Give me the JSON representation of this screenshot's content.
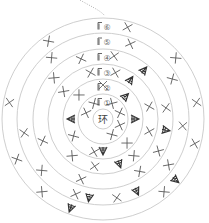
{
  "diagram": {
    "type": "crochet-round-chart",
    "center_label": "环",
    "row_labels": [
      "①",
      "②",
      "③",
      "④",
      "⑤",
      "⑥"
    ],
    "chain_icon": "chain-start-icon",
    "symbols": {
      "single_crochet": "x-stitch-icon",
      "increase": "increase-stitch-icon"
    },
    "colors": {
      "ring": "#c8c8c8",
      "stitch": "#555555",
      "increase": "#333333"
    },
    "rounds": [
      {
        "round": 1,
        "sc": [
          [
            -30,
            18
          ],
          [
            30,
            18
          ],
          [
            -70,
            18
          ],
          [
            70,
            18
          ],
          [
            110,
            18
          ],
          [
            150,
            18
          ]
        ],
        "inc": []
      },
      {
        "round": 2,
        "sc": [
          [
            -45,
            34
          ],
          [
            0,
            34
          ],
          [
            135,
            34
          ],
          [
            -120,
            34
          ],
          [
            -165,
            34
          ]
        ],
        "inc": [
          [
            45,
            32
          ],
          [
            90,
            32
          ],
          [
            -90,
            32
          ],
          [
            180,
            32
          ]
        ]
      },
      {
        "round": 3,
        "sc": [
          [
            -55,
            48
          ],
          [
            -15,
            48
          ],
          [
            15,
            48
          ],
          [
            75,
            48
          ],
          [
            105,
            48
          ],
          [
            140,
            48
          ],
          [
            -140,
            48
          ],
          [
            -170,
            48
          ]
        ],
        "inc": [
          [
            35,
            48
          ],
          [
            160,
            48
          ]
        ]
      },
      {
        "round": 4,
        "sc": [
          [
            -50,
            64
          ],
          [
            -20,
            64
          ],
          [
            10,
            64
          ],
          [
            80,
            64
          ],
          [
            120,
            64
          ],
          [
            145,
            64
          ],
          [
            -110,
            64
          ],
          [
            -160,
            64
          ]
        ],
        "inc": [
          [
            40,
            64
          ],
          [
            100,
            64
          ]
        ]
      },
      {
        "round": 5,
        "sc": [
          [
            -40,
            80
          ],
          [
            20,
            80
          ],
          [
            60,
            80
          ],
          [
            95,
            80
          ],
          [
            125,
            80
          ],
          [
            -100,
            80
          ],
          [
            -130,
            80
          ],
          [
            -160,
            80
          ],
          [
            170,
            80
          ]
        ],
        "inc": [
          [
            -170,
            80
          ],
          [
            155,
            80
          ]
        ]
      },
      {
        "round": 6,
        "sc": [
          [
            -35,
            95
          ],
          [
            15,
            95
          ],
          [
            50,
            95
          ],
          [
            80,
            95
          ],
          [
            105,
            95
          ],
          [
            140,
            95
          ],
          [
            -80,
            95
          ],
          [
            -115,
            95
          ],
          [
            -140,
            95
          ]
        ],
        "inc": [
          [
            -160,
            95
          ],
          [
            130,
            95
          ]
        ]
      }
    ]
  }
}
